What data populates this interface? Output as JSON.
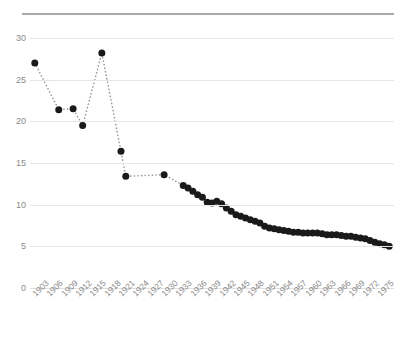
{
  "header": {
    "clipped_title": "",
    "rule_color": "#a8a8a8"
  },
  "colors": {
    "marker": "#1a1a1a",
    "connector": "#9a9a9a",
    "grid": "#e6e6e6",
    "tick_text": "#8a8a8a"
  },
  "chart_data": {
    "type": "scatter",
    "title": "",
    "xlabel": "",
    "ylabel": "",
    "xlim": [
      1902,
      1978
    ],
    "ylim": [
      0,
      30
    ],
    "ytick_labels": [
      "30",
      "25",
      "20",
      "15",
      "10",
      "5",
      "0"
    ],
    "yticks": [
      30,
      25,
      20,
      15,
      10,
      5,
      0
    ],
    "xtick_labels": [
      "1903",
      "1906",
      "1909",
      "1912",
      "1915",
      "1918",
      "1921",
      "1924",
      "1927",
      "1930",
      "1933",
      "1936",
      "1939",
      "1942",
      "1945",
      "1948",
      "1951",
      "1954",
      "1957",
      "1960",
      "1963",
      "1966",
      "1969",
      "1972",
      "1975"
    ],
    "xticks": [
      1903,
      1906,
      1909,
      1912,
      1915,
      1918,
      1921,
      1924,
      1927,
      1930,
      1933,
      1936,
      1939,
      1942,
      1945,
      1948,
      1951,
      1954,
      1957,
      1960,
      1963,
      1966,
      1969,
      1972,
      1975
    ],
    "grid": true,
    "grid_axis": "y",
    "legend": null,
    "connector_style": "dotted",
    "x": [
      1903,
      1908,
      1911,
      1913,
      1917,
      1921,
      1922,
      1930,
      1934,
      1935,
      1936,
      1937,
      1938,
      1939,
      1940,
      1941,
      1942,
      1943,
      1944,
      1945,
      1946,
      1947,
      1948,
      1949,
      1950,
      1951,
      1952,
      1953,
      1954,
      1955,
      1956,
      1957,
      1958,
      1959,
      1960,
      1961,
      1962,
      1963,
      1964,
      1965,
      1966,
      1967,
      1968,
      1969,
      1970,
      1971,
      1972,
      1973,
      1974,
      1975,
      1976,
      1977
    ],
    "y": [
      27.0,
      21.4,
      21.5,
      19.5,
      28.2,
      16.4,
      13.4,
      13.6,
      12.3,
      12.0,
      11.6,
      11.2,
      10.9,
      10.3,
      10.2,
      10.4,
      10.1,
      9.6,
      9.2,
      8.8,
      8.6,
      8.4,
      8.2,
      8.0,
      7.8,
      7.4,
      7.2,
      7.1,
      7.0,
      6.9,
      6.8,
      6.7,
      6.7,
      6.6,
      6.6,
      6.6,
      6.6,
      6.5,
      6.4,
      6.4,
      6.4,
      6.3,
      6.2,
      6.2,
      6.1,
      6.0,
      5.9,
      5.7,
      5.5,
      5.3,
      5.2,
      5.0
    ]
  }
}
